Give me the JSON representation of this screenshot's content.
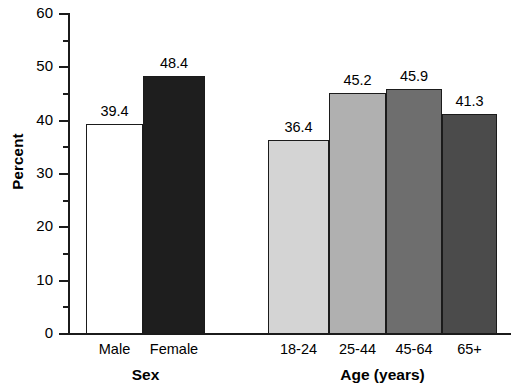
{
  "chart_data": {
    "type": "bar",
    "title": "",
    "xlabel": "",
    "ylabel": "Percent",
    "ylim": [
      0,
      60
    ],
    "ytick_step": 10,
    "yminor_step": 5,
    "grid": false,
    "legend": false,
    "ytick_labels": [
      "60",
      "50",
      "40",
      "30",
      "20",
      "10",
      "0"
    ],
    "ytick_values": [
      60,
      50,
      40,
      30,
      20,
      10,
      0
    ],
    "yminor_values": [
      55,
      45,
      35,
      25,
      15,
      5
    ],
    "groups": [
      {
        "name": "sex",
        "label": "Sex",
        "categories": [
          "Male",
          "Female"
        ],
        "values": [
          39.4,
          48.4
        ],
        "value_labels": [
          "39.4",
          "48.4"
        ],
        "fills": [
          "#ffffff",
          "#1e1e1e"
        ]
      },
      {
        "name": "age",
        "label": "Age (years)",
        "categories": [
          "18-24",
          "25-44",
          "45-64",
          "65+"
        ],
        "values": [
          36.4,
          45.2,
          45.9,
          41.3
        ],
        "value_labels": [
          "36.4",
          "45.2",
          "45.9",
          "41.3"
        ],
        "fills": [
          "#d4d4d4",
          "#b0b0b0",
          "#6e6e6e",
          "#4b4b4b"
        ]
      }
    ]
  },
  "colors": {
    "axis": "#1b1b1b",
    "text": "#000000",
    "background": "#ffffff"
  }
}
